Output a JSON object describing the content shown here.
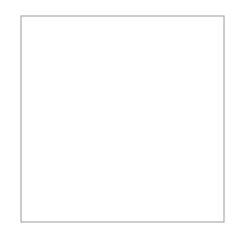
{
  "chart_data": {
    "type": "line",
    "title": "",
    "xlabel": "",
    "ylabel": "",
    "xlim": [
      1,
      15
    ],
    "ylim": [
      0,
      50
    ],
    "x_tick_labels": [
      "1",
      "15"
    ],
    "y_tick_labels": [
      "0",
      "50"
    ],
    "grid": true,
    "grid_style": {
      "horizontal": "dotted",
      "vertical": "solid",
      "color": "#9a9a9a"
    },
    "x_divisions": 10,
    "y_divisions": 10,
    "legend": null,
    "series": [
      {
        "name": "curve",
        "color": "#555555",
        "x": [
          1,
          2.4,
          3.8,
          5.2,
          6.6,
          8,
          9.4,
          10.8,
          12.2,
          13.6,
          15
        ],
        "y": [
          16.7,
          18.2,
          19.8,
          21.6,
          23.4,
          25.3,
          27.4,
          29.7,
          32.2,
          35.0,
          38.1
        ]
      }
    ]
  }
}
